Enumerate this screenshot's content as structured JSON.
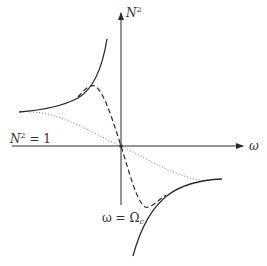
{
  "diagram": {
    "type": "dispersion-plot",
    "axes": {
      "y_label_base": "N",
      "y_label_sup": "2",
      "x_label": "ω"
    },
    "annotations": {
      "horizontal_line_label_base": "N",
      "horizontal_line_label_sup": "2",
      "horizontal_line_label_rest": " = 1",
      "resonance_label_left": "ω = Ω",
      "resonance_label_sub": "c"
    },
    "curves": [
      {
        "name": "solid-upper-left",
        "style": "solid"
      },
      {
        "name": "solid-lower-right",
        "style": "solid"
      },
      {
        "name": "dashed-transition",
        "style": "dashed"
      },
      {
        "name": "dotted-transition",
        "style": "dotted"
      }
    ],
    "colors": {
      "line": "#2a2a2a",
      "dotted": "#777777",
      "text": "#333333"
    }
  }
}
